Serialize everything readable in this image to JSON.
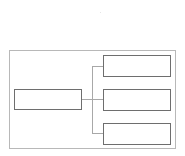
{
  "diagram": {
    "type": "tree",
    "colors": {
      "outer_border": "#b8b8b8",
      "node_border": "#6e6e6e",
      "connector": "#a8a8a8",
      "background": "#ffffff"
    },
    "root": {
      "label": ""
    },
    "children": [
      {
        "label": ""
      },
      {
        "label": ""
      },
      {
        "label": ""
      }
    ]
  }
}
